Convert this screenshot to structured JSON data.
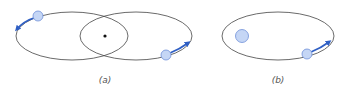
{
  "colors": {
    "orbit": "#444444",
    "planet_fill": "#c5d6f5",
    "planet_stroke": "#6f8fd8",
    "arrow": "#2f5fc4",
    "center_dot": "#111111",
    "caption": "#555555"
  },
  "panels": [
    {
      "id": "a",
      "caption": "(a)",
      "orbits": [
        {
          "cx": 72,
          "cy": 36,
          "rx": 56,
          "ry": 24
        },
        {
          "cx": 136,
          "cy": 36,
          "rx": 56,
          "ry": 24
        }
      ],
      "center_dot": {
        "cx": 105,
        "cy": 36,
        "r": 1.6
      },
      "bodies": [
        {
          "cx": 38,
          "cy": 16,
          "r": 5,
          "arrow": {
            "from": [
              34,
              18
            ],
            "ctrl": [
              24,
              21
            ],
            "to": [
              17,
              29
            ]
          }
        },
        {
          "cx": 166,
          "cy": 55,
          "r": 5,
          "arrow": {
            "from": [
              170,
              53
            ],
            "ctrl": [
              180,
              49
            ],
            "to": [
              188,
              43
            ]
          }
        }
      ]
    },
    {
      "id": "b",
      "caption": "(b)",
      "orbits": [
        {
          "cx": 278,
          "cy": 36,
          "rx": 56,
          "ry": 24
        }
      ],
      "central_body": {
        "cx": 242,
        "cy": 36,
        "r": 6.5
      },
      "bodies": [
        {
          "cx": 307,
          "cy": 54,
          "r": 5,
          "arrow": {
            "from": [
              311,
              52
            ],
            "ctrl": [
              321,
              48
            ],
            "to": [
              329,
              42
            ]
          }
        }
      ]
    }
  ]
}
